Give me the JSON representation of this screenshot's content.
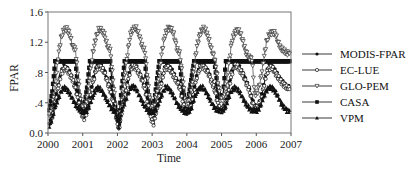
{
  "chart_data": {
    "type": "line",
    "title": "",
    "xlabel": "Time",
    "ylabel": "FPAR",
    "xlim": [
      2000,
      2007
    ],
    "ylim": [
      0.0,
      1.6
    ],
    "x_ticks": [
      "2000",
      "2001",
      "2002",
      "2003",
      "2004",
      "2005",
      "2006",
      "2007"
    ],
    "y_ticks": [
      "0.0",
      ".4",
      ".8",
      "1.2",
      "1.6"
    ],
    "grid": false,
    "legend_position": "right",
    "x_resolution": "monthly (approx., 12 points per year, Jan 2000 - Dec 2006)",
    "series": [
      {
        "name": "MODIS-FPAR",
        "marker": "circle-filled",
        "values": [
          0.12,
          0.25,
          0.45,
          0.62,
          0.8,
          0.88,
          0.86,
          0.8,
          0.72,
          0.62,
          0.45,
          0.28,
          0.22,
          0.3,
          0.48,
          0.68,
          0.85,
          0.9,
          0.88,
          0.82,
          0.7,
          0.6,
          0.42,
          0.25,
          0.05,
          0.3,
          0.5,
          0.68,
          0.86,
          0.9,
          0.88,
          0.8,
          0.72,
          0.6,
          0.4,
          0.22,
          0.15,
          0.32,
          0.55,
          0.75,
          0.88,
          0.88,
          0.85,
          0.78,
          0.7,
          0.62,
          0.45,
          0.3,
          0.3,
          0.4,
          0.58,
          0.78,
          0.88,
          0.9,
          0.86,
          0.8,
          0.7,
          0.6,
          0.45,
          0.32,
          0.32,
          0.42,
          0.6,
          0.8,
          0.9,
          0.9,
          0.85,
          0.78,
          0.68,
          0.6,
          0.45,
          0.35,
          0.35,
          0.45,
          0.62,
          0.8,
          0.88,
          0.88,
          0.82,
          0.76,
          0.7,
          0.65,
          0.62,
          0.6
        ]
      },
      {
        "name": "EC-LUE",
        "marker": "circle-open",
        "values": [
          0.1,
          0.22,
          0.4,
          0.6,
          0.78,
          0.85,
          0.84,
          0.78,
          0.7,
          0.58,
          0.42,
          0.25,
          0.2,
          0.28,
          0.45,
          0.65,
          0.82,
          0.88,
          0.86,
          0.8,
          0.68,
          0.55,
          0.4,
          0.22,
          0.04,
          0.28,
          0.48,
          0.66,
          0.84,
          0.88,
          0.86,
          0.78,
          0.7,
          0.58,
          0.38,
          0.2,
          0.12,
          0.3,
          0.52,
          0.72,
          0.86,
          0.86,
          0.82,
          0.75,
          0.68,
          0.6,
          0.42,
          0.28,
          0.28,
          0.38,
          0.55,
          0.75,
          0.86,
          0.88,
          0.84,
          0.78,
          0.68,
          0.58,
          0.42,
          0.3,
          0.3,
          0.4,
          0.58,
          0.78,
          0.88,
          0.88,
          0.82,
          0.76,
          0.66,
          0.58,
          0.42,
          0.33,
          0.33,
          0.42,
          0.6,
          0.78,
          0.86,
          0.86,
          0.8,
          0.74,
          0.68,
          0.64,
          0.6,
          0.58
        ]
      },
      {
        "name": "GLO-PEM",
        "marker": "triangle-down-open",
        "values": [
          0.2,
          0.35,
          0.6,
          1.0,
          1.25,
          1.36,
          1.38,
          1.3,
          1.15,
          1.1,
          0.7,
          0.35,
          0.3,
          0.45,
          0.75,
          1.05,
          1.25,
          1.36,
          1.36,
          1.3,
          1.15,
          1.1,
          0.7,
          0.3,
          0.05,
          0.45,
          0.75,
          1.05,
          1.3,
          1.38,
          1.38,
          1.3,
          1.15,
          1.08,
          0.7,
          0.35,
          0.3,
          0.5,
          0.8,
          1.1,
          1.3,
          1.38,
          1.38,
          1.3,
          1.12,
          1.05,
          0.75,
          0.4,
          0.4,
          0.55,
          0.85,
          1.15,
          1.3,
          1.38,
          1.36,
          1.25,
          1.1,
          1.0,
          0.75,
          0.45,
          0.45,
          0.6,
          0.9,
          1.2,
          1.32,
          1.36,
          1.32,
          1.2,
          1.05,
          1.0,
          0.98,
          0.5,
          0.55,
          0.7,
          0.95,
          1.2,
          1.3,
          1.33,
          1.32,
          1.2,
          1.12,
          1.08,
          1.06,
          1.05
        ]
      },
      {
        "name": "CASA",
        "marker": "square-filled",
        "values": [
          0.3,
          0.55,
          0.95,
          0.95,
          0.95,
          0.95,
          0.95,
          0.95,
          0.95,
          0.95,
          0.55,
          0.35,
          0.35,
          0.6,
          0.95,
          0.95,
          0.95,
          0.95,
          0.95,
          0.95,
          0.95,
          0.95,
          0.5,
          0.3,
          0.2,
          0.6,
          0.95,
          0.95,
          0.95,
          0.95,
          0.95,
          0.95,
          0.95,
          0.95,
          0.55,
          0.35,
          0.35,
          0.65,
          0.95,
          0.95,
          0.95,
          0.95,
          0.95,
          0.95,
          0.95,
          0.95,
          0.6,
          0.4,
          0.45,
          0.7,
          0.95,
          0.95,
          0.95,
          0.95,
          0.95,
          0.95,
          0.95,
          0.95,
          0.65,
          0.45,
          0.5,
          0.95,
          0.95,
          0.95,
          0.95,
          0.95,
          0.95,
          0.95,
          0.95,
          0.95,
          0.95,
          0.95,
          0.95,
          0.95,
          0.95,
          0.95,
          0.95,
          0.95,
          0.95,
          0.95,
          0.95,
          0.95,
          0.95,
          0.95
        ]
      },
      {
        "name": "VPM",
        "marker": "triangle-up-filled",
        "values": [
          0.1,
          0.2,
          0.35,
          0.45,
          0.55,
          0.6,
          0.58,
          0.52,
          0.45,
          0.38,
          0.32,
          0.3,
          0.28,
          0.3,
          0.38,
          0.48,
          0.58,
          0.6,
          0.56,
          0.5,
          0.42,
          0.35,
          0.3,
          0.28,
          0.1,
          0.3,
          0.4,
          0.5,
          0.6,
          0.62,
          0.58,
          0.5,
          0.42,
          0.35,
          0.3,
          0.28,
          0.28,
          0.32,
          0.42,
          0.52,
          0.6,
          0.6,
          0.55,
          0.48,
          0.4,
          0.34,
          0.3,
          0.28,
          0.28,
          0.32,
          0.45,
          0.55,
          0.6,
          0.6,
          0.55,
          0.48,
          0.4,
          0.34,
          0.3,
          0.3,
          0.3,
          0.35,
          0.48,
          0.56,
          0.6,
          0.58,
          0.52,
          0.45,
          0.38,
          0.33,
          0.3,
          0.3,
          0.3,
          0.36,
          0.48,
          0.56,
          0.6,
          0.6,
          0.55,
          0.48,
          0.4,
          0.34,
          0.3,
          0.3
        ]
      }
    ]
  },
  "legend": {
    "items": [
      {
        "label": "MODIS-FPAR",
        "marker": "circle-filled"
      },
      {
        "label": "EC-LUE",
        "marker": "circle-open"
      },
      {
        "label": "GLO-PEM",
        "marker": "triangle-down-open"
      },
      {
        "label": "CASA",
        "marker": "square-filled"
      },
      {
        "label": "VPM",
        "marker": "triangle-up-filled"
      }
    ]
  },
  "axes": {
    "xlabel": "Time",
    "ylabel": "FPAR"
  }
}
